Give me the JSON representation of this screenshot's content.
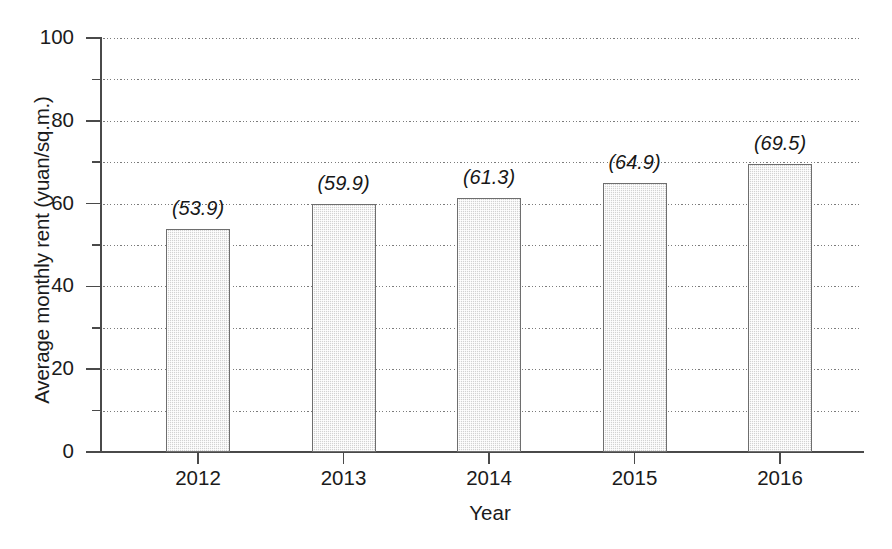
{
  "chart_data": {
    "type": "bar",
    "title": "",
    "subtitle": "",
    "xlabel": "Year",
    "ylabel": "Average monthly rent (yuan/sq.m.)",
    "categories": [
      "2012",
      "2013",
      "2014",
      "2015",
      "2016"
    ],
    "values": [
      53.9,
      59.9,
      61.3,
      64.9,
      69.5
    ],
    "point_labels": [
      "(53.9)",
      "(59.9)",
      "(61.3)",
      "(64.9)",
      "(69.5)"
    ],
    "series": [
      {
        "name": "Average monthly rent",
        "values": [
          53.9,
          59.9,
          61.3,
          64.9,
          69.5
        ]
      }
    ],
    "ylim": [
      0,
      100
    ],
    "y_major_ticks": [
      0,
      20,
      40,
      60,
      80,
      100
    ],
    "y_major_tick_labels": [
      "0",
      "20",
      "40",
      "60",
      "80",
      "100"
    ],
    "y_minor_ticks": [
      10,
      30,
      50,
      70,
      90
    ],
    "gridlines": [
      10,
      20,
      30,
      40,
      50,
      60,
      70,
      80,
      90,
      100
    ],
    "grid": true,
    "grid_style": "dotted",
    "legend": null,
    "legend_position": "none",
    "bar_fill_color": "#d2d2d2",
    "bar_edge_color": "#6e6e6e",
    "axis_color": "#4a4a4a",
    "grid_color": "#646464",
    "background_color": "#ffffff",
    "label_style": "italic-parentheses"
  }
}
